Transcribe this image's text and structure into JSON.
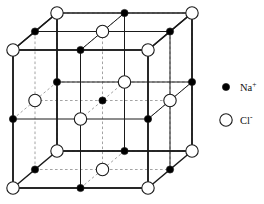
{
  "figure": {
    "projection": "oblique",
    "grid_divisions": 2,
    "colors": {
      "cation_fill": "#000000",
      "anion_fill": "#ffffff",
      "stroke": "#1a1a1a",
      "hidden_stroke": "#8c8c8c",
      "background": "#ffffff"
    },
    "geometry": {
      "front_left_x": 13,
      "front_top_y": 50,
      "front_right_x": 148,
      "front_bottom_y": 188,
      "depth_dx": 44,
      "depth_dy": -37
    },
    "radii": {
      "cation": 3.6,
      "anion": 6.2
    }
  },
  "legend": {
    "title": "",
    "items": [
      {
        "marker": "filled-circle",
        "ion": "Na",
        "charge": "+",
        "label": "Na+",
        "color": "#000000",
        "marker_x": 226,
        "marker_y": 87,
        "label_x": 240,
        "label_y": 91
      },
      {
        "marker": "open-circle",
        "ion": "Cl",
        "charge": "-",
        "label": "Cl-",
        "color": "#ffffff",
        "marker_x": 226,
        "marker_y": 120,
        "label_x": 240,
        "label_y": 124
      }
    ]
  },
  "chart_data": {
    "type": "scatter",
    "xlabel": "",
    "ylabel": "",
    "series": [
      {
        "name": "Na+",
        "marker": "filled-circle",
        "count": 14
      },
      {
        "name": "Cl-",
        "marker": "open-circle",
        "count": 13
      }
    ],
    "lattice": {
      "indices": [
        0,
        1,
        2
      ],
      "rule": "ion at (i,j,k) is Na+ when (i+j+k) is odd, Cl- when (i+j+k) is even",
      "origin_ion": "Cl-"
    }
  }
}
